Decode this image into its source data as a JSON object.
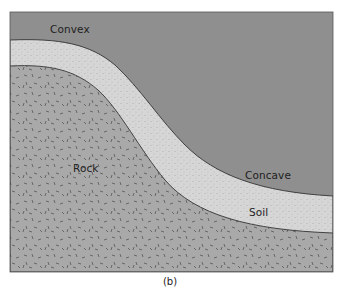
{
  "figure": {
    "caption": "(b)",
    "labels": {
      "convex": "Convex",
      "concave": "Concave",
      "rock": "Rock",
      "soil": "Soil"
    },
    "colors": {
      "sky": "#8f8f8f",
      "soil": "#d6d6d6",
      "rock": "#a9a9a9",
      "outline": "#333333",
      "rock_dash": "#4a4a4a",
      "soil_dot": "#8a8a8a"
    }
  }
}
